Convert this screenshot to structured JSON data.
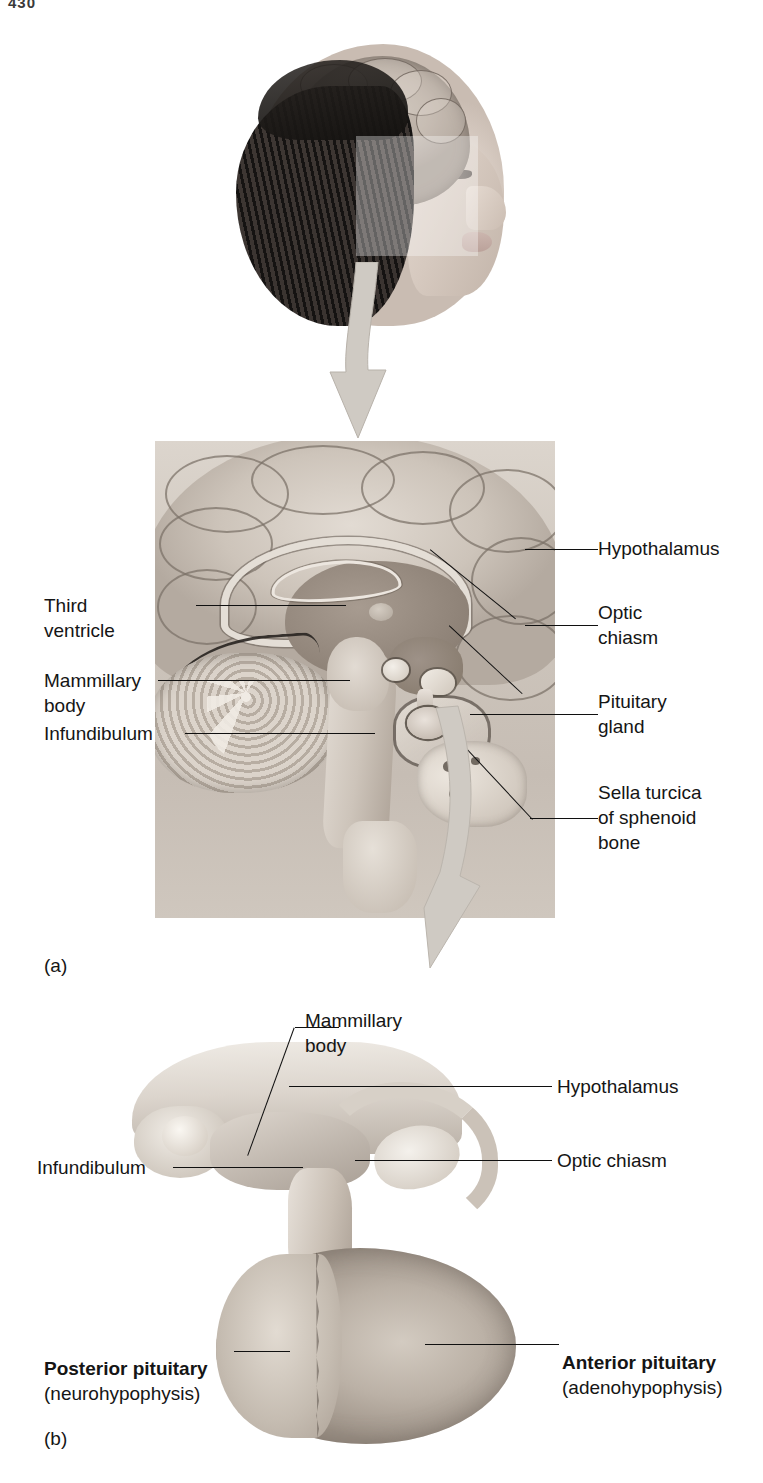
{
  "page": {
    "number": "430",
    "background_color": "#ffffff"
  },
  "figure_a": {
    "caption": "(a)",
    "labels": [
      {
        "id": "hypothalamus",
        "text": "Hypothalamus",
        "side": "right"
      },
      {
        "id": "optic-chiasm",
        "text": "Optic\nchiasm",
        "side": "right"
      },
      {
        "id": "pituitary",
        "text": "Pituitary\ngland",
        "side": "right"
      },
      {
        "id": "sella-turcica",
        "text": "Sella turcica\nof sphenoid\nbone",
        "side": "right"
      },
      {
        "id": "third-ventricle",
        "text": "Third\nventricle",
        "side": "left"
      },
      {
        "id": "mammillary",
        "text": "Mammillary\nbody",
        "side": "left"
      },
      {
        "id": "infundibulum",
        "text": "Infundibulum",
        "side": "left"
      }
    ]
  },
  "figure_b": {
    "caption": "(b)",
    "labels": [
      {
        "id": "mammillary-b",
        "text": "Mammillary\nbody",
        "side": "top"
      },
      {
        "id": "hypothalamus-b",
        "text": "Hypothalamus",
        "side": "right"
      },
      {
        "id": "optic-chiasm-b",
        "text": "Optic chiasm",
        "side": "right"
      },
      {
        "id": "infundibulum-b",
        "text": "Infundibulum",
        "side": "left"
      }
    ],
    "posterior": {
      "name": "Posterior pituitary",
      "alt_name": "(neurohypophysis)"
    },
    "anterior": {
      "name": "Anterior pituitary",
      "alt_name": "(adenohypophysis)"
    }
  },
  "illustration": {
    "head_figure": "sagittal-head-with-brain",
    "arrow_1": "down-arrow-head-to-brain",
    "arrow_2": "down-arrow-brain-to-pituitary",
    "arrow_color": "#cfcac3"
  }
}
